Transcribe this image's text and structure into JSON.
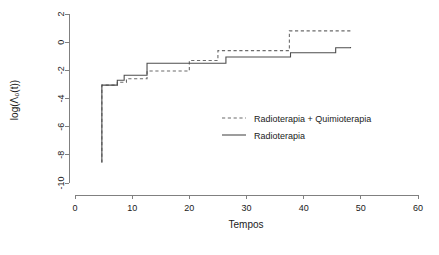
{
  "chart_data": {
    "type": "line",
    "title": "",
    "xlabel": "Tempos",
    "ylabel": "log(Λ₀(t))",
    "xlim": [
      0,
      60
    ],
    "ylim": [
      -10,
      2
    ],
    "xticks": [
      0,
      10,
      20,
      30,
      40,
      50,
      60
    ],
    "yticks": [
      2,
      0,
      -2,
      -4,
      -6,
      -8,
      -10
    ],
    "grid": false,
    "legend_position": "center-right",
    "series": [
      {
        "name": "Radioterapia + Quimioterapia",
        "style": "dashed",
        "color": "#6b6b6b",
        "step": "hv",
        "x": [
          4.7,
          4.7,
          7.4,
          9.0,
          12.6,
          20.0,
          25.0,
          37.5,
          48.2
        ],
        "y": [
          -8.55,
          -3.05,
          -2.85,
          -2.6,
          -2.05,
          -1.3,
          -0.6,
          0.8,
          0.95
        ]
      },
      {
        "name": "Radioterapia",
        "style": "solid",
        "color": "#4d4d4d",
        "step": "hv",
        "x": [
          4.7,
          4.7,
          7.4,
          8.6,
          12.6,
          26.4,
          37.7,
          45.6,
          48.2
        ],
        "y": [
          -8.55,
          -3.05,
          -2.7,
          -2.35,
          -1.5,
          -1.05,
          -0.75,
          -0.4,
          -0.35
        ]
      }
    ],
    "legend": [
      {
        "label": "Radioterapia + Quimioterapia",
        "style": "dashed"
      },
      {
        "label": "Radioterapia",
        "style": "solid"
      }
    ]
  }
}
